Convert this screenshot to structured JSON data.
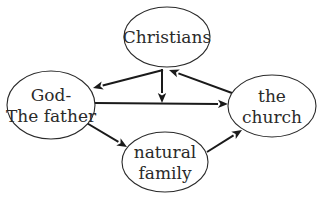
{
  "diagram": {
    "nodes": [
      {
        "id": "christians",
        "lines": [
          "Christians"
        ],
        "cx": 167,
        "cy": 37,
        "rx": 43,
        "ry": 30
      },
      {
        "id": "god",
        "lines": [
          "God-",
          "The father"
        ],
        "cx": 51,
        "cy": 105,
        "rx": 44,
        "ry": 34
      },
      {
        "id": "church",
        "lines": [
          "the",
          "church"
        ],
        "cx": 272,
        "cy": 106,
        "rx": 44,
        "ry": 31
      },
      {
        "id": "family",
        "lines": [
          "natural",
          "family"
        ],
        "cx": 165,
        "cy": 162,
        "rx": 43,
        "ry": 30
      }
    ],
    "edges": [
      {
        "from": "christians",
        "to": "god",
        "x1": 163,
        "y1": 70,
        "x2": 93,
        "y2": 88
      },
      {
        "from": "christians",
        "to": "god-church-edge",
        "x1": 162,
        "y1": 69,
        "x2": 162,
        "y2": 103
      },
      {
        "from": "god",
        "to": "church",
        "x1": 95,
        "y1": 103,
        "x2": 228,
        "y2": 104
      },
      {
        "from": "church",
        "to": "christians",
        "x1": 232,
        "y1": 93,
        "x2": 169,
        "y2": 70
      },
      {
        "from": "god",
        "to": "family",
        "x1": 85,
        "y1": 122,
        "x2": 127,
        "y2": 147
      },
      {
        "from": "family",
        "to": "church",
        "x1": 207,
        "y1": 152,
        "x2": 242,
        "y2": 130
      }
    ]
  }
}
